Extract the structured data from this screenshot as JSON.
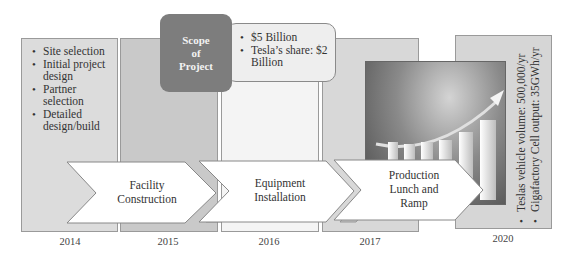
{
  "timeline": {
    "years": [
      "2014",
      "2015",
      "2016",
      "2017",
      "2020"
    ],
    "columns": [
      {
        "year": "2014",
        "bullets": [
          "Site selection",
          "Initial project design",
          "Partner selection",
          "Detailed design/build"
        ]
      },
      {
        "year": "2015"
      },
      {
        "year": "2016"
      },
      {
        "year": "2017"
      },
      {
        "year": "2020",
        "bullets": [
          "Teslas vehicle volume: 500,000/yr",
          "Gigafactory Cell output: 35GWh/yr"
        ]
      }
    ]
  },
  "scope": {
    "title": "Scope of Project",
    "title_lines": [
      "Scope",
      "of",
      "Project"
    ],
    "bullets": [
      "$5 Billion",
      "Tesla’s share: $2 Billion"
    ]
  },
  "phases": [
    {
      "label_lines": [
        "Facility",
        "Construction"
      ]
    },
    {
      "label_lines": [
        "Equipment",
        "Installation"
      ]
    },
    {
      "label_lines": [
        "Production",
        "Lunch and",
        "Ramp"
      ]
    }
  ],
  "image": {
    "description": "growth-bar-chart-with-arrow"
  },
  "colors": {
    "scope_box": "#7d7d7d",
    "col_light": "#dcdcdc",
    "col_mid": "#c9c9c9",
    "col_white": "#f4f4f4"
  }
}
